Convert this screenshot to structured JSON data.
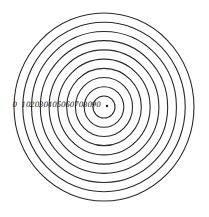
{
  "diagram": {
    "type": "concentric-circles",
    "center": {
      "x": 104,
      "y": 107
    },
    "outer_radius_x": 90,
    "outer_radius_y": 94,
    "ring_count": 10,
    "stroke_color": "#2a2a2a",
    "background": "#ffffff",
    "labels": [
      "0",
      "10",
      "20",
      "30",
      "40",
      "50",
      "60",
      "70",
      "80",
      "90"
    ],
    "center_marker": "dot"
  }
}
